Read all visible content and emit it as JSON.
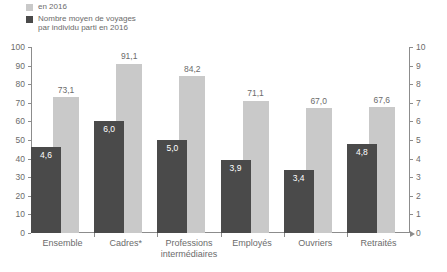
{
  "legend": {
    "items": [
      {
        "label": "en 2016",
        "swatch": "light",
        "color": "#c9c9c9"
      },
      {
        "label": "Nombre moyen de voyages\npar individu parti en 2016",
        "swatch": "dark",
        "color": "#4a4a4a"
      }
    ]
  },
  "chart_data": {
    "type": "bar",
    "title": "",
    "xlabel": "",
    "categories": [
      "Ensemble",
      "Cadres*",
      "Professions\nintermédiaires",
      "Employés",
      "Ouvriers",
      "Retraités"
    ],
    "series": [
      {
        "name": "en 2016",
        "axis": "left",
        "color": "#c9c9c9",
        "values": [
          73.1,
          91.1,
          84.2,
          71.1,
          67.0,
          67.6
        ],
        "labels": [
          "73,1",
          "91,1",
          "84,2",
          "71,1",
          "67,0",
          "67,6"
        ]
      },
      {
        "name": "Nombre moyen de voyages par individu parti en 2016",
        "axis": "right",
        "color": "#4a4a4a",
        "values": [
          4.6,
          6.0,
          5.0,
          3.9,
          3.4,
          4.8
        ],
        "labels": [
          "4,6",
          "6,0",
          "5,0",
          "3,9",
          "3,4",
          "4,8"
        ]
      }
    ],
    "axes": {
      "left": {
        "ylim": [
          0,
          100
        ],
        "ticks": [
          0,
          10,
          20,
          30,
          40,
          50,
          60,
          70,
          80,
          90,
          100
        ],
        "tick_labels": [
          "0",
          "10",
          "20",
          "30",
          "40",
          "50",
          "60",
          "70",
          "80",
          "90",
          "100"
        ],
        "ylabel": ""
      },
      "right": {
        "ylim": [
          0,
          10
        ],
        "ticks": [
          0,
          1,
          2,
          3,
          4,
          5,
          6,
          7,
          8,
          9,
          10
        ],
        "tick_labels": [
          "0",
          "1",
          "2",
          "3",
          "4",
          "5",
          "6",
          "7",
          "8",
          "9",
          "10"
        ],
        "ylabel": ""
      }
    },
    "grid": false,
    "legend_position": "top-left"
  }
}
